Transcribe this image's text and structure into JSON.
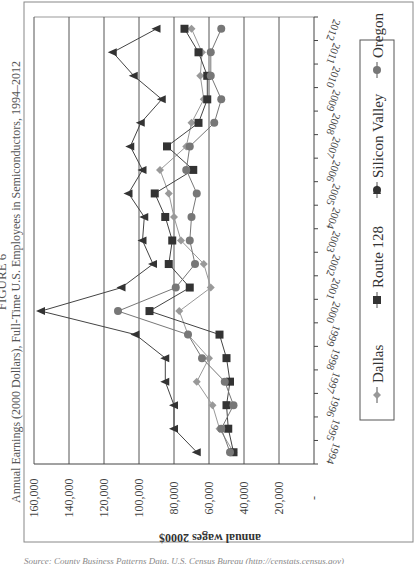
{
  "figure": {
    "label": "FIGURE 6",
    "title": "Annual Earnings (2000 Dollars), Full-Time U.S. Employees in Semiconductors, 1994–2012",
    "source": "Source: County Business Patterns Data, U.S. Census Bureau (http://censtats.census.gov)",
    "orientation": "rotated 90° counter-clockwise"
  },
  "chart_data": {
    "type": "line",
    "title": "Annual Earnings (2000 Dollars), Full-Time U.S. Employees in Semiconductors, 1994–2012",
    "xlabel": "",
    "ylabel": "annual wages 2000$",
    "ylim": [
      0,
      160000
    ],
    "yticks": [
      "-",
      "20,000",
      "40,000",
      "60,000",
      "80,000",
      "100,000",
      "120,000",
      "140,000",
      "160,000"
    ],
    "grid": true,
    "legend_position": "bottom",
    "categories": [
      "1994",
      "1995",
      "1996",
      "1997",
      "1998",
      "1999",
      "2000",
      "2001",
      "2002",
      "2003",
      "2004",
      "2005",
      "2006",
      "2007",
      "2008",
      "2009",
      "2010",
      "2011",
      "2012"
    ],
    "series": [
      {
        "name": "Dallas",
        "marker": "diamond",
        "color": "#999999",
        "values": [
          46000,
          54000,
          58000,
          67000,
          60000,
          72000,
          77000,
          59000,
          63000,
          76000,
          80000,
          83000,
          88000,
          73000,
          70000,
          63000,
          65000,
          64000,
          70000
        ]
      },
      {
        "name": "Route 128",
        "marker": "square",
        "color": "#333333",
        "values": [
          46000,
          49000,
          50000,
          48000,
          50000,
          54000,
          94000,
          71000,
          83000,
          81000,
          85000,
          91000,
          69000,
          84000,
          66000,
          61000,
          61000,
          66000,
          74000
        ]
      },
      {
        "name": "Silicon Valley",
        "marker": "triangle",
        "color": "#333333",
        "values": [
          67000,
          80000,
          80000,
          85000,
          85000,
          102000,
          156000,
          110000,
          92000,
          98000,
          97000,
          106000,
          98000,
          105000,
          99000,
          87000,
          103000,
          115000,
          90000
        ]
      },
      {
        "name": "Oregon",
        "marker": "circle",
        "color": "#777777",
        "values": [
          48000,
          53000,
          46000,
          51000,
          64000,
          72000,
          112000,
          79000,
          68000,
          71000,
          70000,
          67000,
          73000,
          71000,
          57000,
          53000,
          59000,
          59000,
          53000
        ]
      }
    ]
  },
  "legend": {
    "items": [
      {
        "label": "Dallas"
      },
      {
        "label": "Route 128"
      },
      {
        "label": "Silicon Valley"
      },
      {
        "label": "Oregon"
      }
    ]
  },
  "axis": {
    "y_label": "annual wages 2000$",
    "y_ticks": [
      "160,000",
      "140,000",
      "120,000",
      "100,000",
      "80,000",
      "60,000",
      "40,000",
      "20,000",
      "-"
    ],
    "x_ticks": [
      "1994",
      "1995",
      "1996",
      "1997",
      "1998",
      "1999",
      "2000",
      "2001",
      "2002",
      "2003",
      "2004",
      "2005",
      "2006",
      "2007",
      "2008",
      "2009",
      "2010",
      "2011",
      "2012"
    ]
  }
}
